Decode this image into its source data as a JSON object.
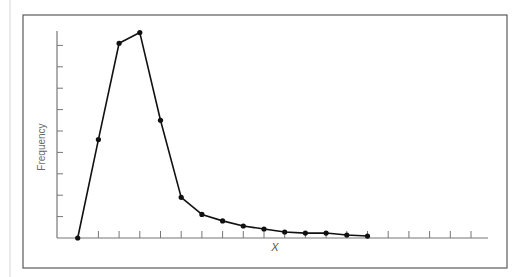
{
  "chart_data": {
    "type": "line",
    "title": "",
    "xlabel": "X",
    "ylabel": "Frequency",
    "x_tick_labels": [],
    "y_tick_labels": [],
    "grid": false,
    "legend": null,
    "x": [
      1,
      2,
      3,
      4,
      5,
      6,
      7,
      8,
      9,
      10,
      11,
      12,
      13,
      14,
      15
    ],
    "values": [
      0,
      4.6,
      9.1,
      9.6,
      5.5,
      1.9,
      1.1,
      0.8,
      0.56,
      0.42,
      0.28,
      0.23,
      0.23,
      0.14,
      0.09
    ],
    "xlim": [
      0,
      21
    ],
    "ylim": [
      0,
      9.7
    ],
    "x_tick_count": 20,
    "y_tick_count": 9,
    "markers": "filled-circle",
    "line_color": "#111111",
    "axis_color": "#777777",
    "frame_color": "#555555"
  }
}
